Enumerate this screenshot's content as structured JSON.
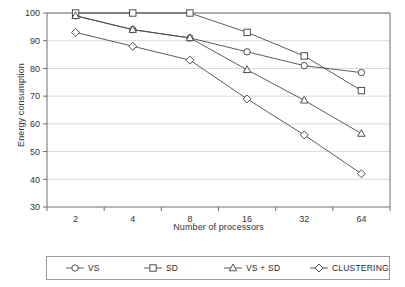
{
  "chart_data": {
    "type": "line",
    "title": "",
    "xlabel": "Number of processors",
    "ylabel": "Energy consumption",
    "categories": [
      "2",
      "4",
      "8",
      "16",
      "32",
      "64"
    ],
    "ylim": [
      30,
      100
    ],
    "yticks": [
      "30",
      "40",
      "50",
      "60",
      "70",
      "80",
      "90",
      "100"
    ],
    "grid": "horizontal",
    "legend_position": "bottom",
    "series": [
      {
        "name": "VS",
        "marker": "circle",
        "values": [
          99,
          94,
          91,
          86,
          81,
          78.5
        ]
      },
      {
        "name": "SD",
        "marker": "square",
        "values": [
          100,
          100,
          100,
          93,
          84.5,
          72
        ]
      },
      {
        "name": "VS + SD",
        "marker": "triangle",
        "values": [
          99,
          94,
          91,
          79.5,
          68.5,
          56.5
        ]
      },
      {
        "name": "CLUSTERING",
        "marker": "diamond",
        "values": [
          93,
          88,
          83,
          69,
          56,
          42
        ]
      }
    ]
  },
  "colors": {
    "line": "#4a4a4a",
    "marker_stroke": "#3c3c3c",
    "marker_fill": "#ffffff",
    "grid": "#d9d9d9",
    "axis": "#6e6e6e",
    "text": "#333333",
    "background": "#ffffff"
  },
  "legend": {
    "items": [
      {
        "label": "VS",
        "marker": "circle"
      },
      {
        "label": "SD",
        "marker": "square"
      },
      {
        "label": "VS + SD",
        "marker": "triangle"
      },
      {
        "label": "CLUSTERING",
        "marker": "diamond"
      }
    ]
  }
}
